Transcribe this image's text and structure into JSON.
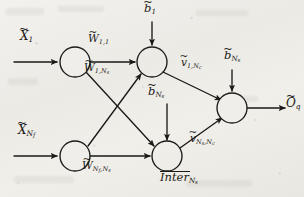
{
  "figure": {
    "type": "node-edge-diagram",
    "background_color": "#efeeea",
    "ink_color": "#1b1a18"
  },
  "nodes": [
    {
      "id": "in1",
      "name": "input-node-1",
      "cx": 75,
      "cy": 62,
      "r": 15
    },
    {
      "id": "inNf",
      "name": "input-node-nf",
      "cx": 75,
      "cy": 156,
      "r": 15
    },
    {
      "id": "h1",
      "name": "hidden-node-1",
      "cx": 152,
      "cy": 62,
      "r": 15
    },
    {
      "id": "hNs",
      "name": "hidden-node-ns",
      "cx": 167,
      "cy": 156,
      "r": 15
    },
    {
      "id": "out",
      "name": "output-node-q",
      "cx": 232,
      "cy": 108,
      "r": 15
    }
  ],
  "labels": {
    "input_1": {
      "base": "X",
      "tilde": true,
      "sub": "1"
    },
    "input_nf": {
      "base": "X",
      "tilde": true,
      "sub": "N",
      "subsub": "f"
    },
    "weight_11": {
      "base": "W",
      "tilde": true,
      "sub": "1,1"
    },
    "weight_1ns": {
      "base": "W",
      "tilde": true,
      "sub": "1,N",
      "subsub": "s"
    },
    "weight_nfns": {
      "base": "W",
      "tilde": true,
      "sub": "N",
      "subsub": "f",
      "sub2": ",N",
      "subsub2": "s"
    },
    "bias_1": {
      "base": "b",
      "tilde": true,
      "sub": "1"
    },
    "bias_ns_mid": {
      "base": "b",
      "tilde": true,
      "sub": "N",
      "subsub": "s"
    },
    "bias_ns_top": {
      "base": "b",
      "tilde": true,
      "sub": "N",
      "subsub": "s"
    },
    "v_1nc": {
      "base": "v",
      "tilde": true,
      "sub": "1,N",
      "subsub": "c"
    },
    "v_nsnc": {
      "base": "v",
      "tilde": true,
      "sub": "N",
      "subsub": "s",
      "sub2": ",N",
      "subsub2": "c"
    },
    "inter_ns": {
      "base": "Inter",
      "bar": true,
      "sub": "N",
      "subsub": "s"
    },
    "output_q": {
      "base": "O",
      "tilde": true,
      "sub": "q"
    }
  },
  "label_text": {
    "input_1": "X̃₁",
    "input_nf": "X̃_{N_f}",
    "weight_11": "W̃_{1,1}",
    "weight_1ns": "W̃_{1,N_s}",
    "weight_nfns": "W̃_{N_f,N_s}",
    "bias_1": "b̃_{1}",
    "bias_ns_mid": "b̃_{N_s}",
    "bias_ns_top": "b̃_{N_s}",
    "v_1nc": "ṽ_{1,N_c}",
    "v_nsnc": "ṽ_{N_s,N_c}",
    "inter_ns": "Inter_{N_s}",
    "output_q": "Õ_{q}"
  },
  "edges": [
    {
      "name": "edge-input1-to-hidden1",
      "from": "in1",
      "to": "h1",
      "label": "weight_11"
    },
    {
      "name": "edge-input1-to-hiddenns",
      "from": "in1",
      "to": "hNs",
      "label": "weight_1ns"
    },
    {
      "name": "edge-inputnf-to-hidden1",
      "from": "inNf",
      "to": "h1",
      "label": ""
    },
    {
      "name": "edge-inputnf-to-hiddenns",
      "from": "inNf",
      "to": "hNs",
      "label": "weight_nfns"
    },
    {
      "name": "edge-hidden1-to-output",
      "from": "h1",
      "to": "out",
      "label": "v_1nc"
    },
    {
      "name": "edge-hiddenns-to-output",
      "from": "hNs",
      "to": "out",
      "label": "v_nsnc"
    },
    {
      "name": "edge-bias1-to-hidden1",
      "from": "bias_1",
      "to": "h1",
      "label": "bias_1"
    },
    {
      "name": "edge-biasns-to-hiddenns",
      "from": "bias_ns_mid",
      "to": "hNs",
      "label": "bias_ns_mid"
    },
    {
      "name": "edge-biasns-to-output",
      "from": "bias_ns_top",
      "to": "out",
      "label": "bias_ns_top"
    },
    {
      "name": "edge-source-input1",
      "from": "input_1",
      "to": "in1",
      "label": "input_1"
    },
    {
      "name": "edge-source-inputnf",
      "from": "input_nf",
      "to": "inNf",
      "label": "input_nf"
    },
    {
      "name": "edge-output-arrow",
      "from": "out",
      "to": "output_q",
      "label": "output_q"
    }
  ]
}
